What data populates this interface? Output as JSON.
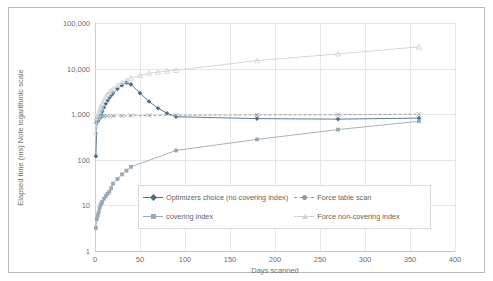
{
  "chart_data": {
    "type": "line",
    "title": "",
    "xlabel": "Days scanned",
    "ylabel": "Elapsed time (ms) Note logarithmic scale",
    "yscale": "log",
    "ylim": [
      1,
      100000
    ],
    "xlim": [
      0,
      400
    ],
    "grid": true,
    "legend_position": "inside-bottom-center",
    "ytick_labels": [
      "100,000",
      "10,000",
      "1,000",
      "100",
      "10",
      "1"
    ],
    "ytick_values": [
      100000,
      10000,
      1000,
      100,
      10,
      1
    ],
    "xtick_labels": [
      "0",
      "50",
      "100",
      "150",
      "200",
      "250",
      "300",
      "350",
      "400"
    ],
    "xtick_values": [
      0,
      50,
      100,
      150,
      200,
      250,
      300,
      350,
      400
    ],
    "series": [
      {
        "name": "Optimizers choice (no covering index)",
        "color": "#4a6d8c",
        "marker": "diamond",
        "linestyle": "solid",
        "x": [
          1,
          2,
          3,
          4,
          5,
          6,
          7,
          8,
          10,
          12,
          14,
          16,
          18,
          20,
          25,
          30,
          35,
          40,
          50,
          60,
          70,
          80,
          90,
          180,
          270,
          360
        ],
        "y": [
          120,
          640,
          700,
          760,
          820,
          900,
          1000,
          1150,
          1400,
          1700,
          2000,
          2300,
          2600,
          2900,
          3600,
          4300,
          4900,
          4500,
          2900,
          1900,
          1350,
          1050,
          880,
          800,
          780,
          820
        ]
      },
      {
        "name": "covering index",
        "color": "#9aa9b8",
        "marker": "square",
        "linestyle": "solid",
        "x": [
          1,
          2,
          3,
          4,
          5,
          6,
          7,
          8,
          10,
          12,
          14,
          16,
          18,
          20,
          25,
          30,
          35,
          40,
          90,
          180,
          270,
          360
        ],
        "y": [
          3.2,
          5.0,
          6.0,
          7.0,
          8.5,
          10,
          11,
          12,
          14,
          16,
          18,
          20,
          24,
          30,
          38,
          48,
          58,
          70,
          160,
          280,
          460,
          700
        ]
      },
      {
        "name": "Force table scan",
        "color": "#8f9aa6",
        "marker": "cross",
        "linestyle": "dashed",
        "x": [
          1,
          2,
          3,
          4,
          5,
          6,
          8,
          10,
          14,
          20,
          30,
          40,
          60,
          90,
          180,
          270,
          360
        ],
        "y": [
          700,
          780,
          820,
          850,
          870,
          880,
          890,
          900,
          905,
          910,
          920,
          930,
          940,
          950,
          960,
          975,
          1000
        ]
      },
      {
        "name": "Force non-covering index",
        "color": "#c9d3dd",
        "marker": "triangle",
        "linestyle": "solid",
        "x": [
          1,
          2,
          3,
          4,
          5,
          6,
          7,
          8,
          10,
          12,
          14,
          16,
          18,
          20,
          25,
          30,
          35,
          40,
          50,
          60,
          70,
          80,
          90,
          180,
          270,
          360
        ],
        "y": [
          400,
          700,
          850,
          1000,
          1150,
          1300,
          1500,
          1700,
          2050,
          2400,
          2700,
          3000,
          3300,
          3600,
          4300,
          5000,
          5600,
          6200,
          7100,
          7900,
          8400,
          8800,
          9200,
          15000,
          21000,
          30000
        ]
      }
    ]
  },
  "legend": {
    "items": [
      {
        "label": "Optimizers choice (no covering index)"
      },
      {
        "label": "Force table scan"
      },
      {
        "label": "covering index"
      },
      {
        "label": "Force non-covering index"
      }
    ]
  },
  "axes": {
    "x_title": "Days scanned",
    "y_title": "Elapsed time (ms) Note logarithmic scale"
  }
}
